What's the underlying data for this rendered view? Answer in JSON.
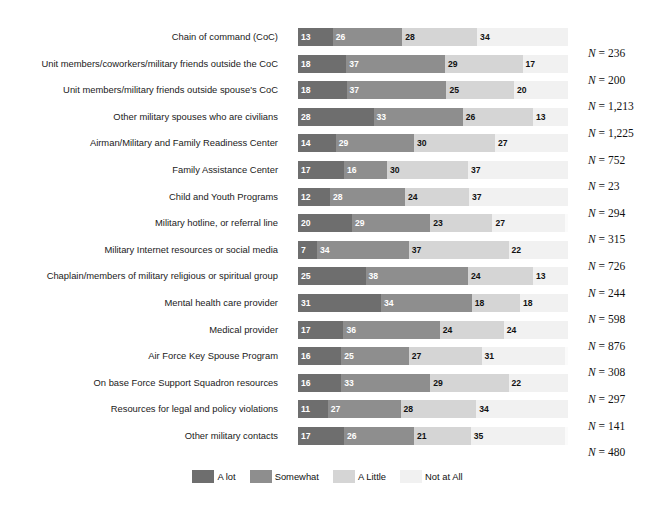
{
  "super_title": "",
  "legend": {
    "position": "bottom-center",
    "entries": [
      {
        "label": "A lot",
        "color": "#6e6e6e"
      },
      {
        "label": "Somewhat",
        "color": "#8e8e8e"
      },
      {
        "label": "A Little",
        "color": "#d5d5d5"
      },
      {
        "label": "Not at All",
        "color": "#f1f1f1"
      }
    ]
  },
  "n_prefix": "N = ",
  "chart_data": {
    "type": "bar",
    "orientation": "horizontal",
    "stacked": true,
    "stack_total": 100,
    "units": "percent",
    "title": "",
    "xlabel": "",
    "ylabel": "",
    "xlim": [
      0,
      100
    ],
    "grid": false,
    "legend_position": "bottom-center",
    "categories": [
      "Chain of command (CoC)",
      "Unit members/coworkers/military friends outside the CoC",
      "Unit members/military friends outside spouse's CoC",
      "Other military spouses who are civilians",
      "Airman/Military and Family Readiness Center",
      "Family Assistance Center",
      "Child and Youth Programs",
      "Military hotline, or referral line",
      "Military Internet resources or social media",
      "Chaplain/members of military religious or spiritual group",
      "Mental health care provider",
      "Medical provider",
      "Air Force Key Spouse Program",
      "On base Force Support Squadron resources",
      "Resources for legal and policy violations",
      "Other military contacts"
    ],
    "series": [
      {
        "name": "A lot",
        "color": "#6e6e6e",
        "values": [
          13,
          18,
          18,
          28,
          14,
          17,
          12,
          20,
          7,
          25,
          31,
          17,
          16,
          16,
          11,
          17
        ]
      },
      {
        "name": "Somewhat",
        "color": "#8e8e8e",
        "values": [
          26,
          37,
          37,
          33,
          29,
          16,
          28,
          29,
          34,
          38,
          34,
          36,
          25,
          33,
          27,
          26
        ]
      },
      {
        "name": "A Little",
        "color": "#d5d5d5",
        "values": [
          28,
          29,
          25,
          26,
          30,
          30,
          24,
          23,
          37,
          24,
          18,
          24,
          27,
          29,
          28,
          21
        ]
      },
      {
        "name": "Not at All",
        "color": "#f1f1f1",
        "values": [
          34,
          17,
          20,
          13,
          27,
          37,
          37,
          27,
          22,
          13,
          18,
          24,
          31,
          22,
          34,
          35
        ]
      }
    ],
    "n_values": [
      236,
      200,
      "1,213",
      "1,225",
      752,
      23,
      294,
      315,
      726,
      244,
      598,
      876,
      308,
      297,
      141,
      480
    ]
  }
}
